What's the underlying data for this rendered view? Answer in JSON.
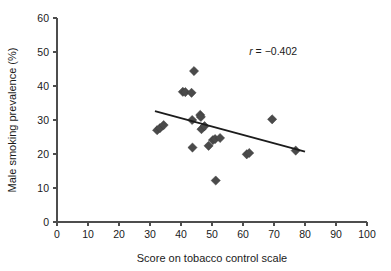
{
  "chart_data": {
    "type": "scatter",
    "title": "",
    "xlabel": "Score on tobacco control scale",
    "ylabel": "Male smoking prevalence (%)",
    "xlim": [
      0,
      100
    ],
    "ylim": [
      0,
      60
    ],
    "xticks": [
      0,
      10,
      20,
      30,
      40,
      50,
      60,
      70,
      80,
      90,
      100
    ],
    "yticks": [
      0,
      10,
      20,
      30,
      40,
      50,
      60
    ],
    "grid": false,
    "legend": null,
    "marker": "diamond",
    "marker_color": "#4a4a4a",
    "annotations": [
      {
        "name": "correlation-coefficient",
        "text_italic": "r",
        "text": " = −0.402",
        "full_text": "r = −0.402",
        "x": 62,
        "y": 49
      }
    ],
    "points": [
      {
        "x": 32.3,
        "y": 27.0
      },
      {
        "x": 33.2,
        "y": 27.6
      },
      {
        "x": 34.4,
        "y": 28.5
      },
      {
        "x": 40.6,
        "y": 38.3
      },
      {
        "x": 41.4,
        "y": 38.2
      },
      {
        "x": 43.4,
        "y": 38.0
      },
      {
        "x": 44.2,
        "y": 44.4
      },
      {
        "x": 43.6,
        "y": 30.0
      },
      {
        "x": 43.7,
        "y": 21.9
      },
      {
        "x": 46.2,
        "y": 31.5
      },
      {
        "x": 46.4,
        "y": 30.9
      },
      {
        "x": 46.6,
        "y": 27.3
      },
      {
        "x": 47.6,
        "y": 28.2
      },
      {
        "x": 48.9,
        "y": 22.4
      },
      {
        "x": 50.3,
        "y": 24.1
      },
      {
        "x": 51.0,
        "y": 24.4
      },
      {
        "x": 51.2,
        "y": 12.2
      },
      {
        "x": 52.6,
        "y": 24.7
      },
      {
        "x": 61.2,
        "y": 19.9
      },
      {
        "x": 62.0,
        "y": 20.3
      },
      {
        "x": 69.4,
        "y": 30.2
      },
      {
        "x": 77.0,
        "y": 21.0
      }
    ],
    "fit_line": {
      "name": "linear-regression-line",
      "x1": 31.6,
      "y1": 32.6,
      "x2": 80.0,
      "y2": 20.7
    }
  }
}
